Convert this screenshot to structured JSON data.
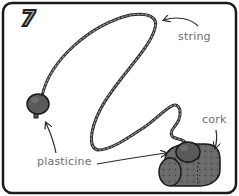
{
  "panel": {
    "step_number": "7",
    "labels": {
      "string": "string",
      "cork": "cork",
      "plasticine": "plasticine"
    }
  },
  "colors": {
    "border": "#1a1a1a",
    "string": "#2a2a2a",
    "plasticine": "#5a5a5a",
    "cork": "#6a6a6a",
    "label_text": "#6e6e6e",
    "step_number_fill": "#b5b5b5"
  }
}
